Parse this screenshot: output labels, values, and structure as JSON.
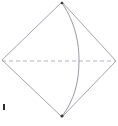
{
  "figure": {
    "kind": "geometry-line-drawing",
    "caption": "",
    "canvas": {
      "width": 118,
      "height": 126,
      "background": "#ffffff"
    },
    "style": {
      "edge_color": "#9a9aa6",
      "edge_width": 0.9,
      "curve_color": "#8d8d99",
      "curve_width": 0.9,
      "dashed_color": "#a9a9b4",
      "dashed_width": 0.9,
      "dash_pattern": "4 3",
      "vertex_marker_color": "#3a3a44",
      "tick_color": "#2b2b33"
    },
    "vertices": {
      "top": {
        "name": "top-vertex",
        "x": 62,
        "y": 2
      },
      "right": {
        "name": "right-vertex",
        "x": 116,
        "y": 61
      },
      "bottom": {
        "name": "bottom-vertex",
        "x": 62,
        "y": 117
      },
      "left": {
        "name": "left-vertex",
        "x": 2,
        "y": 60
      }
    },
    "edges": [
      {
        "name": "edge-top-left",
        "from": "top",
        "to": "left",
        "style": "solid",
        "path": "M 62 2 L 2 60"
      },
      {
        "name": "edge-left-bottom",
        "from": "left",
        "to": "bottom",
        "style": "solid",
        "path": "M 2 60 L 62 117"
      },
      {
        "name": "edge-top-right",
        "from": "top",
        "to": "right",
        "style": "solid",
        "path": "M 62 2 L 116 61"
      },
      {
        "name": "edge-right-bottom",
        "from": "right",
        "to": "bottom",
        "style": "solid",
        "path": "M 116 61 L 62 117"
      }
    ],
    "diagonal": {
      "name": "horizontal-dashed-diagonal",
      "from": "left",
      "to": "right",
      "style": "dashed",
      "path": "M 2 61 L 116 61"
    },
    "arc": {
      "name": "curved-arc",
      "from": "top",
      "to": "bottom",
      "bulge_direction": "right",
      "apex": {
        "x": 79,
        "y": 61
      },
      "path": "M 62 3 C 76 24 79 44 79 61 C 79 82 74 101 62 116"
    },
    "markers": [
      {
        "name": "top-vertex-dot",
        "x": 62,
        "y": 3,
        "r": 1.3
      },
      {
        "name": "bottom-vertex-dot",
        "x": 62,
        "y": 116,
        "r": 1.6
      }
    ],
    "tick_mark": {
      "name": "lower-left-tick-mark",
      "x": 3,
      "y": 104,
      "width": 2,
      "height": 6
    }
  }
}
